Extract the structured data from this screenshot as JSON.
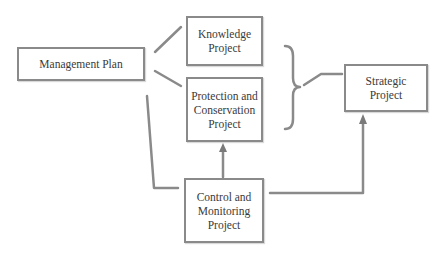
{
  "diagram": {
    "nodes": {
      "management_plan": {
        "label": "Management Plan"
      },
      "knowledge": {
        "label": "Knowledge\nProject"
      },
      "protection": {
        "label": "Protection and\nConservation\nProject"
      },
      "control": {
        "label": "Control and\nMonitoring\nProject"
      },
      "strategic": {
        "label": "Strategic\nProject"
      }
    },
    "edges": [
      {
        "from": "Management Plan",
        "to": "Knowledge Project",
        "type": "line"
      },
      {
        "from": "Management Plan",
        "to": "Protection and Conservation Project",
        "type": "line"
      },
      {
        "from": "Management Plan",
        "to": "Control and Monitoring Project",
        "type": "line"
      },
      {
        "from": "Control and Monitoring Project",
        "to": "Protection and Conservation Project",
        "type": "arrow"
      },
      {
        "from": "Control and Monitoring Project",
        "to": "Strategic Project",
        "type": "arrow"
      },
      {
        "from": "Knowledge Project + Protection and Conservation Project (brace)",
        "to": "Strategic Project",
        "type": "line"
      }
    ],
    "colors": {
      "stroke": "#8a8a8a",
      "text": "#3a3a3a",
      "background": "#ffffff"
    }
  }
}
